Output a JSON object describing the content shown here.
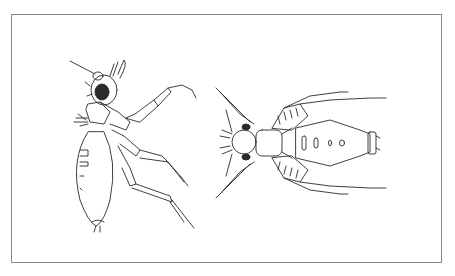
{
  "figure": {
    "frame_border_color": "#8a8a8a",
    "background_color": "#ffffff",
    "line_color": "#2a2a2a",
    "panels": [
      {
        "id": "left",
        "subject": "insect-lateral-view",
        "description": "Insect drawn in lateral view with large compound eye, antenna, long jointed legs and oval abdomen"
      },
      {
        "id": "right",
        "subject": "insect-dorsal-view",
        "description": "Insect drawn in dorsal view with head at left, paired legs splayed outward and broad segmented abdomen with marks"
      }
    ]
  }
}
